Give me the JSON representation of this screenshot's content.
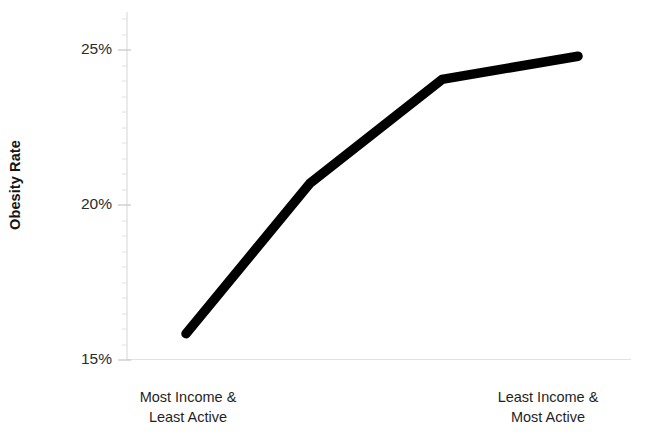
{
  "chart_data": {
    "type": "line",
    "title": "",
    "subtitle": "",
    "xlabel": "",
    "ylabel": "Obesity Rate",
    "x": [
      0,
      1,
      2,
      3
    ],
    "values": [
      15.85,
      20.7,
      24.05,
      24.8
    ],
    "series": [
      {
        "name": "Obesity Rate",
        "values": [
          15.85,
          20.7,
          24.05,
          24.8
        ],
        "color": "#000000"
      }
    ],
    "ylim": [
      15,
      25.5
    ],
    "xlim": [
      0,
      3
    ],
    "yticks": [
      15,
      20,
      25
    ],
    "ytick_labels": [
      "15%",
      "20%",
      "25%"
    ],
    "xtick_labels": [
      "Most Income &\nLeast Active",
      "Least Income &\nMost Active"
    ],
    "grid": false,
    "legend": "none",
    "minor_ticks_axis": "y"
  },
  "axes": {
    "y_title": "Obesity Rate",
    "y_tick_25": "25%",
    "y_tick_20": "20%",
    "y_tick_15": "15%",
    "x_label_left": "Most Income &\nLeast Active",
    "x_label_right": "Least Income &\nMost Active"
  },
  "colors": {
    "line": "#000000",
    "axis": "#d9d9d9",
    "text": "#1f1f1f",
    "background": "#ffffff"
  }
}
